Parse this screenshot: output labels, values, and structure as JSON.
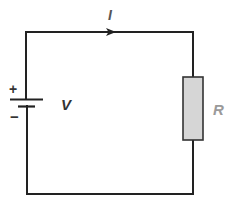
{
  "diagram": {
    "type": "circuit",
    "components": [
      {
        "id": "battery",
        "kind": "dc-voltage-source",
        "label": "V",
        "positive_sign": "+",
        "negative_sign": "−"
      },
      {
        "id": "resistor",
        "kind": "resistor",
        "label": "R"
      }
    ],
    "current": {
      "label": "I",
      "direction": "clockwise (left to right along top wire)"
    }
  },
  "labels": {
    "current": "I",
    "voltage": "V",
    "resistance": "R",
    "plus": "+",
    "minus": "−"
  },
  "colors": {
    "wire": "#222222",
    "resistor_fill": "#d6d6d6",
    "resistor_stroke": "#333333",
    "voltage_label": "#333333",
    "current_label": "#555555",
    "resistance_label": "#9a9a9a"
  }
}
